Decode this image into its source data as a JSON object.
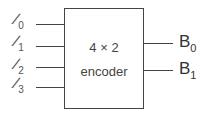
{
  "diagram": {
    "block": {
      "line1": "4 × 2",
      "line2": "encoder"
    },
    "inputs": [
      {
        "name": "I",
        "sub": "0"
      },
      {
        "name": "I",
        "sub": "1"
      },
      {
        "name": "I",
        "sub": "2"
      },
      {
        "name": "I",
        "sub": "3"
      }
    ],
    "outputs": [
      {
        "name": "B",
        "sub": "0"
      },
      {
        "name": "B",
        "sub": "1"
      }
    ],
    "colors": {
      "stroke": "#444444",
      "text": "#333333"
    }
  }
}
